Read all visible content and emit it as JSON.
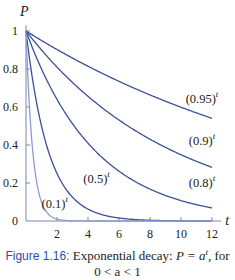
{
  "chart_data": {
    "type": "line",
    "title": "",
    "xlabel": "t",
    "ylabel": "P",
    "xlim": [
      0,
      12.6
    ],
    "ylim": [
      0,
      1.05
    ],
    "xticks": [
      2,
      4,
      6,
      8,
      10,
      12
    ],
    "yticks": [
      0,
      0.2,
      0.4,
      0.6,
      0.8,
      1
    ],
    "xtick_labels": [
      "2",
      "4",
      "6",
      "8",
      "10",
      "12"
    ],
    "ytick_labels": [
      "0",
      "0.2",
      "0.4",
      "0.6",
      "0.8",
      "1"
    ],
    "grid": false,
    "legend": "none (inline curve labels)",
    "function": "P = a^t",
    "series": [
      {
        "name": "(0.95)^t",
        "base": 0.95,
        "label": "(0.95)",
        "label_pos": {
          "t": 10.3,
          "P": 0.62
        }
      },
      {
        "name": "(0.9)^t",
        "base": 0.9,
        "label": "(0.9)",
        "label_pos": {
          "t": 10.5,
          "P": 0.4
        }
      },
      {
        "name": "(0.8)^t",
        "base": 0.8,
        "label": "(0.8)",
        "label_pos": {
          "t": 10.5,
          "P": 0.18
        }
      },
      {
        "name": "(0.5)^t",
        "base": 0.5,
        "label": "(0.5)",
        "label_pos": {
          "t": 3.7,
          "P": 0.2
        }
      },
      {
        "name": "(0.1)^t",
        "base": 0.1,
        "label": "(0.1)",
        "label_pos": {
          "t": 1.0,
          "P": 0.07
        }
      }
    ],
    "colors": {
      "curve": "#3b4f9a",
      "axis": "#7d86b4",
      "caption_accent": "#2e4fa3"
    }
  },
  "caption": {
    "figure_label": "Figure 1.16:",
    "text_line1": "Exponential decay: ",
    "formula": "P = a",
    "formula_sup": "t",
    "text_line1_end": ", for",
    "line2": "0 < a < 1"
  }
}
